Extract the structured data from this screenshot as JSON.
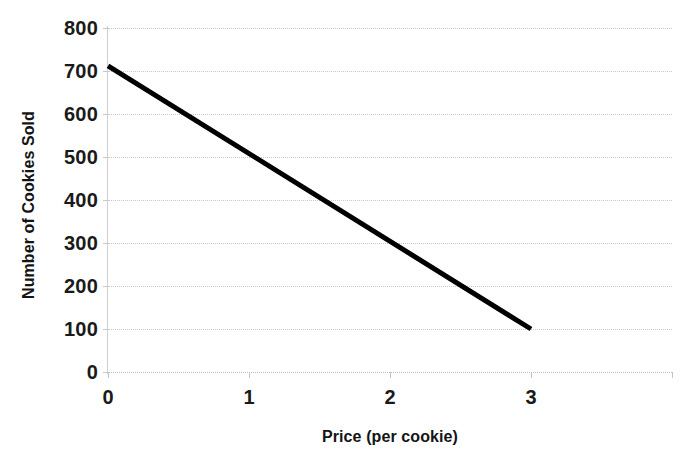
{
  "chart_data": {
    "type": "line",
    "title": "",
    "subtitle": "",
    "xlabel": "Price (per cookie)",
    "ylabel": "Number of Cookies Sold",
    "xlim": [
      0,
      4
    ],
    "ylim": [
      0,
      800
    ],
    "x_ticks": [
      "0",
      "1",
      "2",
      "3"
    ],
    "x_tick_values": [
      0,
      1,
      2,
      3
    ],
    "y_ticks": [
      "0",
      "100",
      "200",
      "300",
      "400",
      "500",
      "600",
      "700",
      "800"
    ],
    "y_tick_values": [
      0,
      100,
      200,
      300,
      400,
      500,
      600,
      700,
      800
    ],
    "grid": "horizontal",
    "legend": "none",
    "series": [
      {
        "name": "Demand",
        "color": "#000000",
        "line_width": 5,
        "x": [
          0,
          3
        ],
        "values": [
          712,
          100
        ]
      }
    ],
    "annotations": []
  },
  "colors": {
    "background": "#ffffff",
    "gridline": "#c9c9c9",
    "axis": "#d0d0d0",
    "text": "#141414",
    "series": "#000000"
  }
}
